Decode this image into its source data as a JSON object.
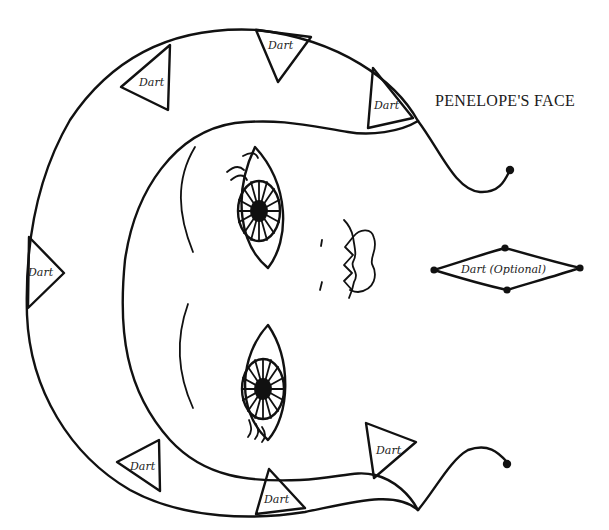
{
  "diagram": {
    "title": "PENELOPE'S FACE",
    "type": "sewing-pattern-piece",
    "darts": [
      {
        "label": "Dart",
        "position": "top-center"
      },
      {
        "label": "Dart",
        "position": "top-left"
      },
      {
        "label": "Dart",
        "position": "top-right"
      },
      {
        "label": "Dart",
        "position": "left"
      },
      {
        "label": "Dart",
        "position": "bottom-left"
      },
      {
        "label": "Dart",
        "position": "bottom-center"
      },
      {
        "label": "Dart",
        "position": "bottom-right"
      }
    ],
    "optional_dart": {
      "label": "Dart (Optional)"
    },
    "features": [
      "upper-eye",
      "lower-eye",
      "lips",
      "nose-marks",
      "brow-lines",
      "tie-tails"
    ],
    "colors": {
      "line": "#111111",
      "background": "#ffffff"
    }
  }
}
